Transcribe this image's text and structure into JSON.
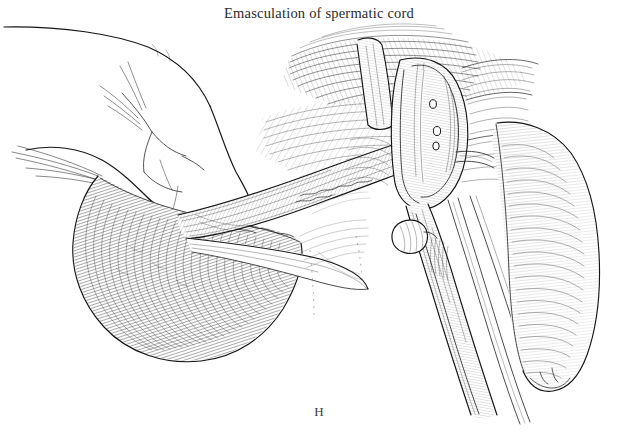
{
  "figure": {
    "caption": "Emasculation of spermatic cord",
    "panel_letter": "H",
    "medium": "pen-and-ink line drawing",
    "background_color": "#ffffff",
    "ink_color": "#1a1a1a"
  },
  "subjects": [
    {
      "name": "surgeon-hand",
      "label": "Surgeon's hand grasping tissue",
      "position": "upper-left",
      "shading": "clean outline, minimal hatching"
    },
    {
      "name": "spermatic-cord",
      "label": "Spermatic cord",
      "position": "center, running diagonally toward instrument jaws",
      "shading": "longitudinal parallel hatching"
    },
    {
      "name": "emasculator-instrument",
      "label": "Emasculator with crushing jaws and thumbscrew",
      "position": "right of center",
      "shading": "cross-hatched metal with highlight reserves"
    },
    {
      "name": "thumbscrew-knob",
      "label": "Thumbscrew knob",
      "position": "mid-right on instrument shaft"
    },
    {
      "name": "scrotal-tissue-mass",
      "label": "Scrotal tissue / testis mass",
      "position": "lower-left",
      "shading": "dense contour hatching and stipple"
    },
    {
      "name": "tissue-flap-right",
      "label": "Retracted tissue flap",
      "position": "right edge",
      "shading": "dense parallel hatching"
    },
    {
      "name": "fascia-hatching",
      "label": "Surrounding fascia and connective tissue",
      "position": "upper-center and right",
      "shading": "sweeping parallel strokes"
    }
  ]
}
